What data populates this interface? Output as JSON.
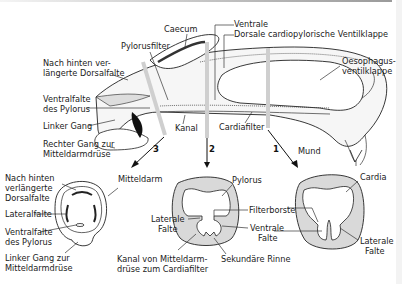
{
  "diagram": {
    "type": "anatomical-diagram",
    "longitudinal_section": {
      "labels": {
        "caecum": "Caecum",
        "pylorusfilter": "Pylorusfilter",
        "ventrale": "Ventrale",
        "dorsale_valve": "Dorsale cardiopylorische Ventilklappe",
        "oesophagus_valve_1": "Oesophagus-",
        "oesophagus_valve_2": "ventilklappe",
        "dorsal_fold_1": "Nach hinten ver-",
        "dorsal_fold_2": "längerte Dorsalfalte",
        "ventral_fold_1": "Ventralfalte",
        "ventral_fold_2": "des Pylorus",
        "left_duct": "Linker Gang",
        "right_duct_1": "Rechter Gang zur",
        "right_duct_2": "Mitteldarmdrüse",
        "kanal": "Kanal",
        "cardiafilter": "Cardiafilter",
        "mund": "Mund"
      },
      "section_markers": [
        "3",
        "2",
        "1"
      ]
    },
    "cross_section_3": {
      "labels": {
        "dorsal_fold_1": "Nach hinten",
        "dorsal_fold_2": "verlängerte",
        "dorsal_fold_3": "Dorsalfalte",
        "mitteldarm": "Mitteldarm",
        "lateral_fold": "Lateralfalte",
        "ventral_fold_1": "Ventralfalte",
        "ventral_fold_2": "des Pylorus",
        "left_duct_1": "Linker Gang zur",
        "left_duct_2": "Mitteldarmdrüse"
      }
    },
    "cross_section_2": {
      "labels": {
        "pylorus": "Pylorus",
        "filterborsten": "Filterborsten",
        "lateral_1": "Laterale",
        "lateral_2": "Falte",
        "ventral_1": "Ventrale",
        "ventral_2": "Falte",
        "kanal_1": "Kanal von Mitteldarm-",
        "kanal_2": "drüse zum Cardiafilter",
        "sekundaer": "Sekundäre Rinne"
      }
    },
    "cross_section_1": {
      "labels": {
        "cardia": "Cardia",
        "lateral_1": "Laterale",
        "lateral_2": "Falte"
      }
    },
    "colors": {
      "tissue_fill": "#d9d9d9",
      "line": "#222222",
      "section_bar": "#cfcfcf"
    }
  }
}
